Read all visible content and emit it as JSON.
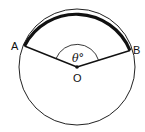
{
  "diagram": {
    "type": "circle-with-central-angle",
    "labels": {
      "point_a": "A",
      "point_b": "B",
      "center": "O",
      "angle": "θ°"
    },
    "colors": {
      "stroke": "#111111",
      "background": "#ffffff"
    }
  }
}
